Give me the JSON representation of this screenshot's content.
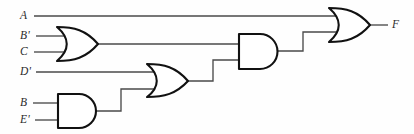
{
  "diagram": {
    "type": "logic-gate-schematic",
    "output_expression": "F = A + (B' + C)(D' + B E')",
    "stroke_color": "#111111",
    "wire_color": "#4a4a4a",
    "background_color": "#ffffff"
  },
  "inputs": [
    {
      "id": "in-a",
      "label": "A",
      "x": 22,
      "y": 16,
      "wire_y": 16
    },
    {
      "id": "in-bp",
      "label": "B'",
      "x": 22,
      "y": 36,
      "wire_y": 36
    },
    {
      "id": "in-c",
      "label": "C",
      "x": 22,
      "y": 52,
      "wire_y": 52
    },
    {
      "id": "in-dp",
      "label": "D'",
      "x": 22,
      "y": 72,
      "wire_y": 72
    },
    {
      "id": "in-b",
      "label": "B",
      "x": 22,
      "y": 103,
      "wire_y": 103
    },
    {
      "id": "in-ep",
      "label": "E'",
      "x": 22,
      "y": 120,
      "wire_y": 120
    }
  ],
  "outputs": [
    {
      "id": "out-f",
      "label": "F",
      "x": 392,
      "y": 25,
      "wire_y": 25
    }
  ],
  "gates": [
    {
      "id": "or-1",
      "kind": "OR",
      "name": "or-gate-bc",
      "inputs": [
        "B'",
        "C"
      ],
      "output_label": ""
    },
    {
      "id": "and-1",
      "kind": "AND",
      "name": "and-gate-be",
      "inputs": [
        "B",
        "E'"
      ],
      "output_label": ""
    },
    {
      "id": "or-2",
      "kind": "OR",
      "name": "or-gate-d-and1",
      "inputs": [
        "D'",
        "and-1"
      ],
      "output_label": ""
    },
    {
      "id": "and-2",
      "kind": "AND",
      "name": "and-gate-or1-or2",
      "inputs": [
        "or-1",
        "or-2"
      ],
      "output_label": ""
    },
    {
      "id": "or-3",
      "kind": "OR",
      "name": "or-gate-output",
      "inputs": [
        "A",
        "and-2"
      ],
      "output_label": "F"
    }
  ]
}
